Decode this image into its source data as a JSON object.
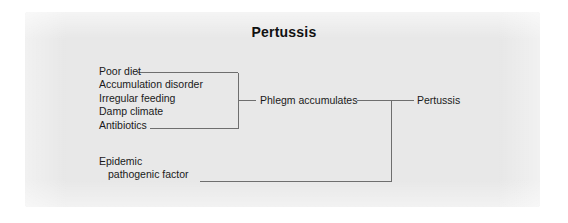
{
  "figure": {
    "title": "Pertussis",
    "panel_color": "#e8e8e8",
    "page_color": "#ffffff",
    "line_color": "#6e6e6e",
    "text_color": "#1a1a1a"
  },
  "diagram": {
    "type": "flow-diagram",
    "causes": [
      {
        "label": "Poor diet"
      },
      {
        "label": "Accumulation disorder"
      },
      {
        "label": "Irregular feeding"
      },
      {
        "label": "Damp climate"
      },
      {
        "label": "Antibiotics"
      }
    ],
    "epidemic": {
      "line1": "Epidemic",
      "line2": "pathogenic factor"
    },
    "intermediate": "Phlegm accumulates",
    "outcome": "Pertussis"
  }
}
